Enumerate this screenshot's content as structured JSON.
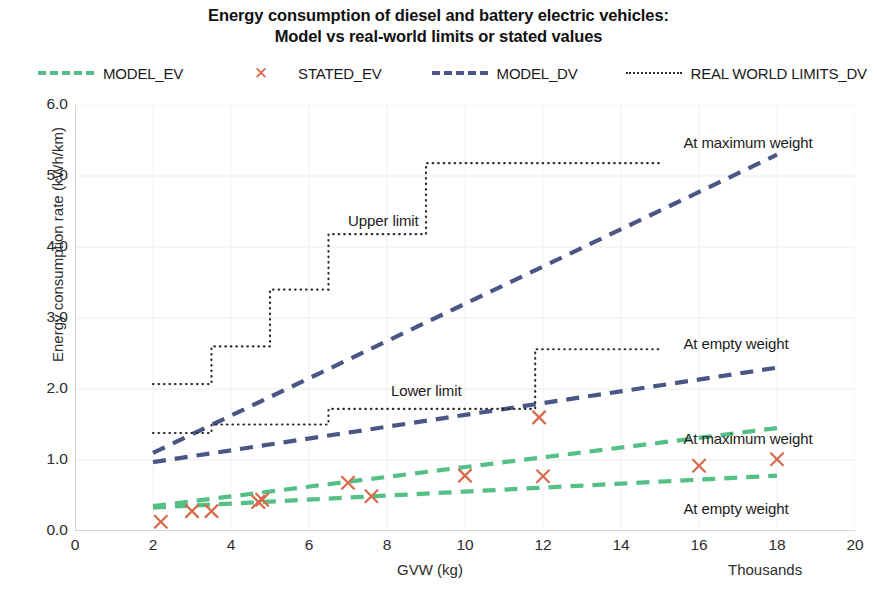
{
  "title": {
    "line1": "Energy consumption of diesel and battery electric vehicles:",
    "line2": "Model vs real-world limits or stated values"
  },
  "legend": {
    "position": "top",
    "items": [
      {
        "label": "MODEL_EV",
        "key": "dashed-line",
        "color": "#54c085"
      },
      {
        "label": "STATED_EV",
        "key": "x-marker",
        "color": "#d9694a",
        "glyph": "✕"
      },
      {
        "label": "MODEL_DV",
        "key": "dashed-line",
        "color": "#4a5685"
      },
      {
        "label": "REAL WORLD LIMITS_DV",
        "key": "dotted-line",
        "color": "#2b2b2b"
      }
    ]
  },
  "axes": {
    "y": {
      "label": "Energy consumption rate (kWh/km)",
      "min": 0,
      "max": 6,
      "step": 1,
      "ticks": [
        "0.0",
        "1.0",
        "2.0",
        "3.0",
        "4.0",
        "5.0",
        "6.0"
      ]
    },
    "x": {
      "label": "GVW (kg)",
      "unit_note": "Thousands",
      "min": 0,
      "max": 20,
      "step": 2,
      "ticks": [
        "0",
        "2",
        "4",
        "6",
        "8",
        "10",
        "12",
        "14",
        "16",
        "18",
        "20"
      ]
    }
  },
  "annotations": [
    {
      "text": "At maximum weight",
      "x": 15.6,
      "y": 5.45,
      "series": "MODEL_DV"
    },
    {
      "text": "Upper limit",
      "x": 7.0,
      "y": 4.35,
      "series": "REAL WORLD LIMITS_DV"
    },
    {
      "text": "At empty weight",
      "x": 15.6,
      "y": 2.62,
      "series": "MODEL_DV"
    },
    {
      "text": "Lower limit",
      "x": 8.1,
      "y": 1.96,
      "series": "REAL WORLD LIMITS_DV"
    },
    {
      "text": "At maximum weight",
      "x": 15.6,
      "y": 1.28,
      "series": "MODEL_EV"
    },
    {
      "text": "At empty weight",
      "x": 15.6,
      "y": 0.3,
      "series": "MODEL_EV"
    }
  ],
  "chart_data": {
    "type": "line",
    "title": "Energy consumption of diesel and battery electric vehicles: Model vs real-world limits or stated values",
    "xlabel": "GVW (kg)",
    "xunit": "Thousands",
    "ylabel": "Energy consumption rate (kWh/km)",
    "xlim": [
      0,
      20
    ],
    "ylim": [
      0,
      6
    ],
    "xticks": [
      0,
      2,
      4,
      6,
      8,
      10,
      12,
      14,
      16,
      18,
      20
    ],
    "yticks": [
      0,
      1,
      2,
      3,
      4,
      5,
      6
    ],
    "grid": "horizontal-and-vertical-faint",
    "legend_position": "top",
    "series": [
      {
        "name": "MODEL_DV",
        "sublabel": "At maximum weight",
        "style": "dashed",
        "color": "#4a5685",
        "points": [
          [
            2.0,
            1.1
          ],
          [
            18.0,
            5.3
          ]
        ]
      },
      {
        "name": "MODEL_DV",
        "sublabel": "At empty weight",
        "style": "dashed",
        "color": "#4a5685",
        "points": [
          [
            2.0,
            0.97
          ],
          [
            18.0,
            2.3
          ]
        ]
      },
      {
        "name": "MODEL_EV",
        "sublabel": "At maximum weight",
        "style": "dashed",
        "color": "#54c085",
        "points": [
          [
            2.0,
            0.35
          ],
          [
            18.0,
            1.45
          ]
        ]
      },
      {
        "name": "MODEL_EV",
        "sublabel": "At empty weight",
        "style": "dashed",
        "color": "#54c085",
        "points": [
          [
            2.0,
            0.33
          ],
          [
            18.0,
            0.78
          ]
        ]
      },
      {
        "name": "REAL WORLD LIMITS_DV",
        "sublabel": "Upper limit",
        "style": "dotted-step",
        "color": "#2b2b2b",
        "points": [
          [
            2.0,
            2.07
          ],
          [
            3.5,
            2.07
          ],
          [
            3.5,
            2.6
          ],
          [
            5.0,
            2.6
          ],
          [
            5.0,
            3.4
          ],
          [
            6.5,
            3.4
          ],
          [
            6.5,
            4.18
          ],
          [
            9.0,
            4.18
          ],
          [
            9.0,
            5.18
          ],
          [
            15.0,
            5.18
          ]
        ]
      },
      {
        "name": "REAL WORLD LIMITS_DV",
        "sublabel": "Lower limit",
        "style": "dotted-step",
        "color": "#2b2b2b",
        "points": [
          [
            2.0,
            1.38
          ],
          [
            3.5,
            1.38
          ],
          [
            3.5,
            1.5
          ],
          [
            6.5,
            1.5
          ],
          [
            6.5,
            1.72
          ],
          [
            11.8,
            1.72
          ],
          [
            11.8,
            2.56
          ],
          [
            15.0,
            2.56
          ]
        ]
      },
      {
        "name": "STATED_EV",
        "style": "x-markers",
        "color": "#d9694a",
        "points": [
          [
            2.2,
            0.13
          ],
          [
            3.0,
            0.28
          ],
          [
            3.5,
            0.28
          ],
          [
            4.7,
            0.41
          ],
          [
            4.8,
            0.44
          ],
          [
            7.0,
            0.68
          ],
          [
            7.6,
            0.49
          ],
          [
            10.0,
            0.78
          ],
          [
            11.9,
            1.6
          ],
          [
            12.0,
            0.77
          ],
          [
            16.0,
            0.92
          ],
          [
            18.0,
            1.01
          ]
        ]
      }
    ]
  }
}
